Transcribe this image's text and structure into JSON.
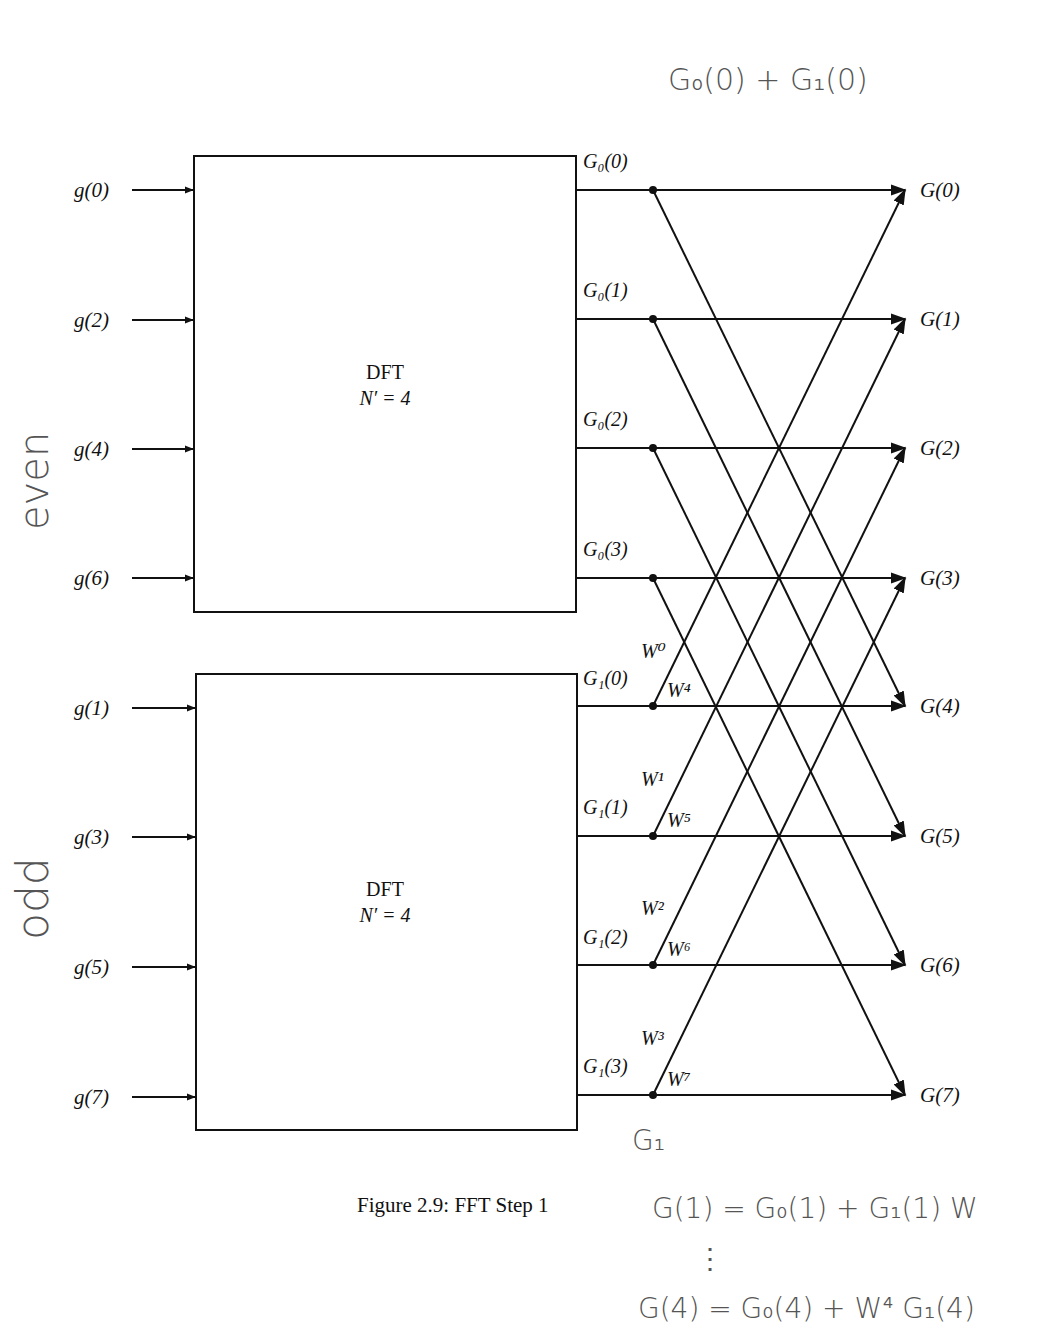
{
  "figure": {
    "caption": "Figure 2.9: FFT Step 1",
    "blocks": [
      {
        "name": "even",
        "title": "DFT",
        "size_label": "N′ = 4",
        "inputs": [
          "g(0)",
          "g(2)",
          "g(4)",
          "g(6)"
        ],
        "outputs": [
          "G₀(0)",
          "G₀(1)",
          "G₀(2)",
          "G₀(3)"
        ]
      },
      {
        "name": "odd",
        "title": "DFT",
        "size_label": "N′ = 4",
        "inputs": [
          "g(1)",
          "g(3)",
          "g(5)",
          "g(7)"
        ],
        "outputs": [
          "G₁(0)",
          "G₁(1)",
          "G₁(2)",
          "G₁(3)"
        ]
      }
    ],
    "final_outputs": [
      "G(0)",
      "G(1)",
      "G(2)",
      "G(3)",
      "G(4)",
      "G(5)",
      "G(6)",
      "G(7)"
    ],
    "twiddle_labels": [
      {
        "upper": "W⁰",
        "lower": "W⁴"
      },
      {
        "upper": "W¹",
        "lower": "W⁵"
      },
      {
        "upper": "W²",
        "lower": "W⁶"
      },
      {
        "upper": "W³",
        "lower": "W⁷"
      }
    ]
  },
  "handwritten": {
    "top_note": "G₀(0) + G₁(0)",
    "even_label": "even",
    "odd_label": "odd",
    "g1_note": "G₁",
    "eq1": "G(1) = G₀(1) + G₁(1) W",
    "ellipsis": "⋮",
    "eq2": "G(4) = G₀(4) + W⁴ G₁(4)"
  }
}
